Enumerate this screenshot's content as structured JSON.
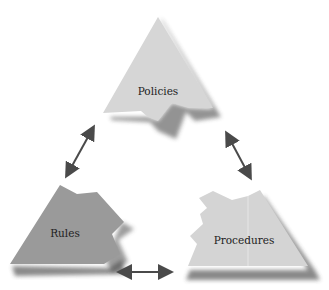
{
  "diagram": {
    "type": "triangular-cycle",
    "nodes": [
      {
        "id": "policies",
        "label": "Policies",
        "fill": "#d6d6d6"
      },
      {
        "id": "rules",
        "label": "Rules",
        "fill": "#9a9a9a"
      },
      {
        "id": "procedures",
        "label": "Procedures",
        "fill": "#d4d4d4"
      }
    ],
    "edges": [
      {
        "from": "policies",
        "to": "rules",
        "style": "double-arrow"
      },
      {
        "from": "policies",
        "to": "procedures",
        "style": "double-arrow"
      },
      {
        "from": "rules",
        "to": "procedures",
        "style": "double-arrow"
      }
    ],
    "colors": {
      "shadow": "#3a3a3a",
      "arrow": "#4a4a4a",
      "background": "#ffffff"
    }
  }
}
